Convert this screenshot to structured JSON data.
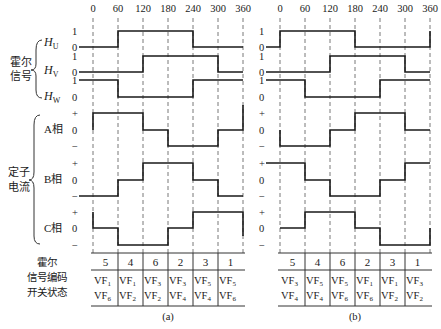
{
  "angles": [
    "0",
    "60",
    "120",
    "180",
    "240",
    "300",
    "360"
  ],
  "row_labels": {
    "hall_group": "霍尔信号",
    "hall_group_lines": [
      "霍尔",
      "信号"
    ],
    "hall": [
      {
        "name": "H",
        "sub": "U"
      },
      {
        "name": "H",
        "sub": "V"
      },
      {
        "name": "H",
        "sub": "W"
      }
    ],
    "current_group_lines": [
      "定子",
      "电流"
    ],
    "phases": [
      "A相",
      "B相",
      "C相"
    ],
    "table_label_lines": [
      "霍尔",
      "信号编码",
      "开关状态"
    ],
    "logic_levels": [
      "1",
      "0"
    ],
    "current_levels": [
      "+",
      "0",
      "−"
    ]
  },
  "panels": [
    {
      "caption": "(a)",
      "hall_waves": {
        "HU": [
          0,
          1,
          1,
          1,
          0,
          0,
          0
        ],
        "HV": [
          0,
          0,
          1,
          1,
          1,
          0
        ],
        "HW": [
          1,
          0,
          0,
          0,
          1,
          1
        ]
      },
      "current_waves": {
        "A": [
          1,
          1,
          0,
          -1,
          -1,
          0
        ],
        "B": [
          -1,
          0,
          1,
          1,
          0,
          -1
        ],
        "C": [
          0,
          -1,
          -1,
          0,
          1,
          1
        ]
      },
      "hall_codes": [
        "5",
        "4",
        "6",
        "2",
        "3",
        "1"
      ],
      "switch_states": [
        {
          "top": "VF",
          "top_sub": "1",
          "bottom": "VF",
          "bottom_sub": "6"
        },
        {
          "top": "VF",
          "top_sub": "1",
          "bottom": "VF",
          "bottom_sub": "2"
        },
        {
          "top": "VF",
          "top_sub": "3",
          "bottom": "VF",
          "bottom_sub": "2"
        },
        {
          "top": "VF",
          "top_sub": "3",
          "bottom": "VF",
          "bottom_sub": "4"
        },
        {
          "top": "VF",
          "top_sub": "5",
          "bottom": "VF",
          "bottom_sub": "4"
        },
        {
          "top": "VF",
          "top_sub": "5",
          "bottom": "VF",
          "bottom_sub": "6"
        }
      ]
    },
    {
      "caption": "(b)",
      "hall_waves": {
        "HU": [
          1,
          1,
          1,
          0,
          0,
          0
        ],
        "HV": [
          0,
          0,
          1,
          1,
          1,
          0
        ],
        "HW": [
          1,
          0,
          0,
          0,
          1,
          1
        ]
      },
      "current_waves": {
        "A": [
          -1,
          -1,
          0,
          1,
          1,
          0
        ],
        "B": [
          1,
          0,
          -1,
          -1,
          0,
          1
        ],
        "C": [
          0,
          1,
          1,
          0,
          -1,
          -1
        ]
      },
      "hall_codes": [
        "5",
        "4",
        "6",
        "2",
        "3",
        "1"
      ],
      "switch_states": [
        {
          "top": "VF",
          "top_sub": "3",
          "bottom": "VF",
          "bottom_sub": "4"
        },
        {
          "top": "VF",
          "top_sub": "5",
          "bottom": "VF",
          "bottom_sub": "4"
        },
        {
          "top": "VF",
          "top_sub": "5",
          "bottom": "VF",
          "bottom_sub": "6"
        },
        {
          "top": "VF",
          "top_sub": "1",
          "bottom": "VF",
          "bottom_sub": "6"
        },
        {
          "top": "VF",
          "top_sub": "1",
          "bottom": "VF",
          "bottom_sub": "2"
        },
        {
          "top": "VF",
          "top_sub": "3",
          "bottom": "VF",
          "bottom_sub": "2"
        }
      ]
    }
  ]
}
